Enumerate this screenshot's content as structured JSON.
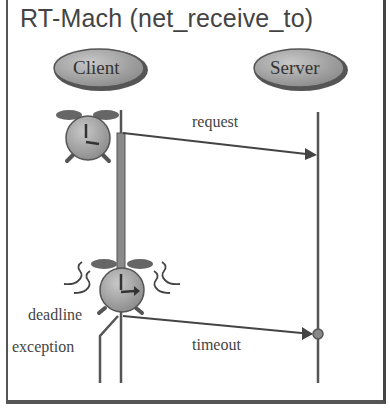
{
  "title": "RT-Mach (net_receive_to)",
  "actors": {
    "client": "Client",
    "server": "Server"
  },
  "messages": {
    "request": "request",
    "timeout": "timeout"
  },
  "annotations": {
    "deadline": "deadline",
    "exception": "exception"
  },
  "icons": [
    "alarm-clock-icon",
    "ringing-alarm-clock-icon"
  ],
  "colors": {
    "line": "#4a4a4a",
    "fill": "#9a9a9a",
    "text": "#444444"
  }
}
